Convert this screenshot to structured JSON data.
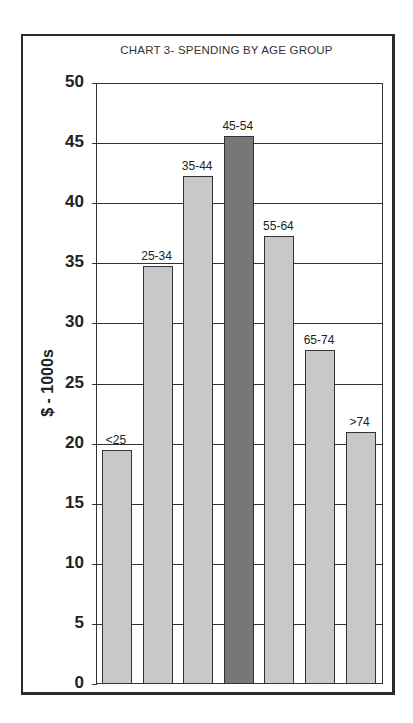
{
  "chart_data": {
    "type": "bar",
    "title": "CHART 3- SPENDING BY AGE GROUP",
    "xlabel": "",
    "ylabel": "$ - 1000s",
    "categories": [
      "<25",
      "25-34",
      "35-44",
      "45-54",
      "55-64",
      "65-74",
      ">74"
    ],
    "values": [
      19.4,
      34.7,
      42.2,
      45.5,
      37.2,
      27.7,
      20.9
    ],
    "highlight_category": "45-54",
    "ylim": [
      0,
      50
    ],
    "yticks": [
      0,
      5,
      10,
      15,
      20,
      25,
      30,
      35,
      40,
      45,
      50
    ],
    "grid": true,
    "legend": null,
    "data_labels": "category names above bars",
    "colors": {
      "bar": "#c8c8c8",
      "highlight_bar": "#777777",
      "grid": "#333333"
    }
  }
}
